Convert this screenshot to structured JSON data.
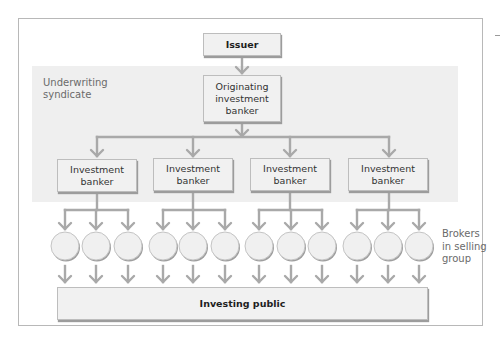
{
  "diagram": {
    "issuer": "Issuer",
    "syndicate_label": "Underwriting\nsyndicate",
    "originating_banker": "Originating\ninvestment\nbanker",
    "investment_bankers": [
      "Investment\nbanker",
      "Investment\nbanker",
      "Investment\nbanker",
      "Investment\nbanker"
    ],
    "brokers_per_banker": 3,
    "brokers_label": "Brokers\nin selling\ngroup",
    "investing_public": "Investing public",
    "colors": {
      "connector": "#a9a9a9",
      "band": "#efefef",
      "box_fill": "#f1f1f1",
      "circle_fill": "#f0f0f0"
    }
  }
}
